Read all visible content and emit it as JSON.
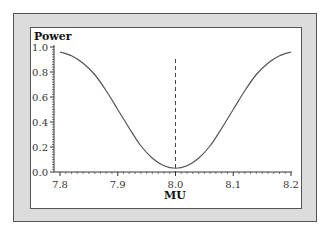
{
  "chart_data": {
    "type": "line",
    "title": "Power",
    "xlabel": "MU",
    "ylabel": "Power",
    "xlim": [
      7.8,
      8.2
    ],
    "ylim": [
      0.0,
      1.0
    ],
    "x_ticks": [
      "7.8",
      "7.9",
      "8.0",
      "8.1",
      "8.2"
    ],
    "y_ticks": [
      "0.0",
      "0.2",
      "0.4",
      "0.6",
      "0.8",
      "1.0"
    ],
    "grid": false,
    "legend": null,
    "reference_line": {
      "type": "vertical",
      "x": 8.0,
      "style": "dashed"
    },
    "series": [
      {
        "name": "Power",
        "x": [
          7.8,
          7.82,
          7.84,
          7.86,
          7.88,
          7.9,
          7.92,
          7.94,
          7.96,
          7.98,
          8.0,
          8.02,
          8.04,
          8.06,
          8.08,
          8.1,
          8.12,
          8.14,
          8.16,
          8.18,
          8.2
        ],
        "values": [
          0.96,
          0.93,
          0.87,
          0.78,
          0.65,
          0.5,
          0.35,
          0.21,
          0.11,
          0.05,
          0.03,
          0.05,
          0.11,
          0.21,
          0.35,
          0.5,
          0.65,
          0.78,
          0.87,
          0.93,
          0.96
        ]
      }
    ]
  },
  "labels": {
    "title": "Power",
    "xlabel": "MU"
  }
}
